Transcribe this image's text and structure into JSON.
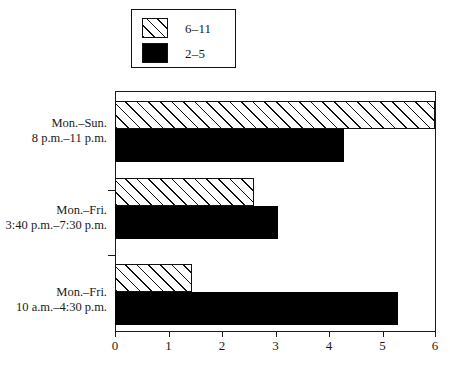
{
  "chart_data": {
    "type": "bar",
    "orientation": "horizontal",
    "title": "",
    "xlabel": "",
    "ylabel": "",
    "xlim": [
      0,
      6
    ],
    "xticks": [
      0,
      1,
      2,
      3,
      4,
      5,
      6
    ],
    "xticklabels": [
      "0",
      "1",
      "2",
      "3",
      "4",
      "5",
      "6"
    ],
    "grid": false,
    "legend_position": "top-left",
    "categories": [
      "Mon.–Sun. 8 p.m.–11 p.m.",
      "Mon.–Fri. 3:40 p.m.–7:30 p.m.",
      "Mon.–Fri. 10 a.m.–4:30 p.m."
    ],
    "category_lines": [
      [
        "Mon.–Sun.",
        "8 p.m.–11 p.m."
      ],
      [
        "Mon.–Fri.",
        "3:40 p.m.–7:30 p.m."
      ],
      [
        "Mon.–Fri.",
        "10 a.m.–4:30 p.m."
      ]
    ],
    "series": [
      {
        "name": "6–11",
        "pattern": "hatch",
        "color": "#ffffff",
        "values": [
          6.0,
          2.6,
          1.45
        ]
      },
      {
        "name": "2–5",
        "pattern": "solid",
        "color": "#000000",
        "values": [
          4.3,
          3.05,
          5.3
        ]
      }
    ]
  },
  "legend": {
    "items": [
      {
        "label": "6–11",
        "swatch": "hatch-swatch"
      },
      {
        "label": "2–5",
        "swatch": "solid-swatch"
      }
    ]
  },
  "axis": {
    "x_tick_labels": [
      "0",
      "1",
      "2",
      "3",
      "4",
      "5",
      "6"
    ]
  }
}
